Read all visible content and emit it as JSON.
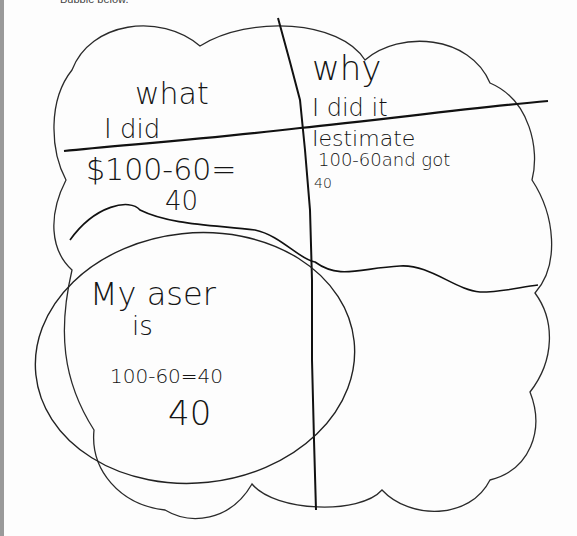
{
  "worksheet": {
    "instruction_text": "Bubble below."
  },
  "bubble": {
    "stroke_color": "#222222",
    "handwriting_color": "#151515",
    "quadrants": {
      "top_left": {
        "heading_line1": "what",
        "heading_line2": "I did",
        "work_line1": "$100-60=",
        "work_line2": "40"
      },
      "top_right": {
        "heading_line1": "why",
        "heading_line2": "I did it",
        "work_line1": "Iestimate",
        "work_line2": "100-60and got",
        "work_line3": "40"
      },
      "bottom_left": {
        "answer_line1": "My aser",
        "answer_line2": "is",
        "answer_line3": "100-60=40",
        "answer_line4": "40"
      },
      "bottom_right": {}
    }
  }
}
